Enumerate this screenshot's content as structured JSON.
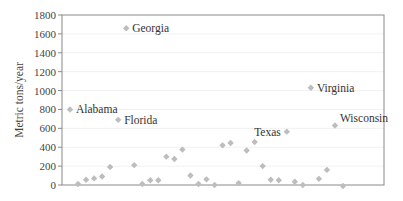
{
  "chart_data": {
    "type": "scatter",
    "title": "",
    "xlabel": "",
    "ylabel": "Metric tons/year",
    "ylim": [
      0,
      1800
    ],
    "yticks": [
      0,
      200,
      400,
      600,
      800,
      1000,
      1200,
      1400,
      1600,
      1800
    ],
    "grid": true,
    "legend": null,
    "marker": "diamond",
    "marker_color": "#bdbdbd",
    "points": [
      {
        "x": 1,
        "y": 800,
        "label": "Alabama"
      },
      {
        "x": 2,
        "y": 10
      },
      {
        "x": 3,
        "y": 55
      },
      {
        "x": 4,
        "y": 70
      },
      {
        "x": 5,
        "y": 90
      },
      {
        "x": 6,
        "y": 190
      },
      {
        "x": 7,
        "y": 690,
        "label": "Florida"
      },
      {
        "x": 8,
        "y": 1660,
        "label": "Georgia"
      },
      {
        "x": 9,
        "y": 210
      },
      {
        "x": 10,
        "y": 10
      },
      {
        "x": 11,
        "y": 50
      },
      {
        "x": 12,
        "y": 50
      },
      {
        "x": 13,
        "y": 300
      },
      {
        "x": 14,
        "y": 275
      },
      {
        "x": 15,
        "y": 375
      },
      {
        "x": 16,
        "y": 100
      },
      {
        "x": 17,
        "y": 10
      },
      {
        "x": 18,
        "y": 60
      },
      {
        "x": 19,
        "y": 0
      },
      {
        "x": 20,
        "y": 420
      },
      {
        "x": 21,
        "y": 445
      },
      {
        "x": 22,
        "y": 20
      },
      {
        "x": 23,
        "y": 365
      },
      {
        "x": 24,
        "y": 455
      },
      {
        "x": 25,
        "y": 200
      },
      {
        "x": 26,
        "y": 55
      },
      {
        "x": 27,
        "y": 50
      },
      {
        "x": 28,
        "y": 565,
        "label": "Texas"
      },
      {
        "x": 29,
        "y": 35
      },
      {
        "x": 30,
        "y": 0
      },
      {
        "x": 31,
        "y": 1030,
        "label": "Virginia"
      },
      {
        "x": 32,
        "y": 65
      },
      {
        "x": 33,
        "y": 160
      },
      {
        "x": 34,
        "y": 630,
        "label": "Wisconsin"
      },
      {
        "x": 35,
        "y": -20
      }
    ]
  }
}
